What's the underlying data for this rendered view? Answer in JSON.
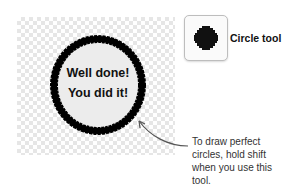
{
  "canvas": {
    "message_line1": "Well done!",
    "message_line2": "You did it!"
  },
  "tool": {
    "icon": "circle-tool-icon",
    "label": "Circle tool"
  },
  "callout": {
    "text": "To draw perfect circles, hold shift when you use this tool."
  },
  "colors": {
    "circle_fill": "#ececec",
    "circle_stroke": "#000000",
    "arrow": "#555555"
  }
}
